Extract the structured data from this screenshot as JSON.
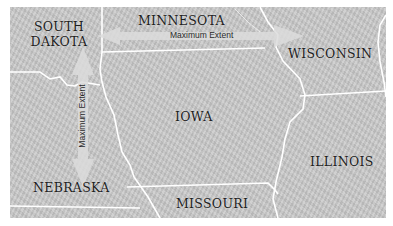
{
  "map": {
    "states": [
      {
        "id": "south-dakota",
        "label": "SOUTH\nDAKOTA"
      },
      {
        "id": "minnesota",
        "label": "MINNESOTA"
      },
      {
        "id": "wisconsin",
        "label": "WISCONSIN"
      },
      {
        "id": "iowa",
        "label": "IOWA"
      },
      {
        "id": "illinois",
        "label": "ILLINOIS"
      },
      {
        "id": "nebraska",
        "label": "NEBRASKA"
      },
      {
        "id": "missouri",
        "label": "MISSOURI"
      }
    ],
    "arrows": {
      "horizontal": {
        "label": "Maximum Extent",
        "orientation": "horizontal"
      },
      "vertical": {
        "label": "Maximum Extent",
        "orientation": "vertical"
      }
    },
    "colors": {
      "land": "#c9c9c9",
      "border": "#ffffff",
      "arrow": "#dcdcdc",
      "label": "#1e1e1e"
    }
  }
}
